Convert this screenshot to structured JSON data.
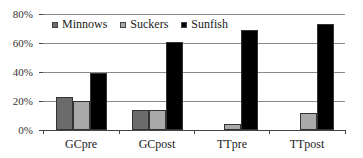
{
  "chart_data": {
    "type": "bar",
    "title": "",
    "xlabel": "",
    "ylabel": "",
    "ylim": [
      0,
      80
    ],
    "y_ticks": [
      "0%",
      "20%",
      "40%",
      "60%",
      "80%"
    ],
    "grid": true,
    "legend_position": "top-left inside",
    "categories": [
      "GCpre",
      "GCpost",
      "TTpre",
      "TTpost"
    ],
    "series": [
      {
        "name": "Minnows",
        "color": "#6b6b6b",
        "values": [
          23,
          14,
          0,
          0
        ]
      },
      {
        "name": "Suckers",
        "color": "#a9a9a9",
        "values": [
          20,
          14,
          4,
          12
        ]
      },
      {
        "name": "Sunfish",
        "color": "#000000",
        "values": [
          39,
          61,
          69,
          73
        ]
      }
    ]
  },
  "legend": {
    "items": [
      {
        "label": "Minnows",
        "color": "#6b6b6b"
      },
      {
        "label": "Suckers",
        "color": "#a9a9a9"
      },
      {
        "label": "Sunfish",
        "color": "#000000"
      }
    ]
  },
  "axis": {
    "y_labels": [
      "80%",
      "60%",
      "40%",
      "20%",
      "0%"
    ],
    "x_labels": [
      "GCpre",
      "GCpost",
      "TTpre",
      "TTpost"
    ]
  }
}
